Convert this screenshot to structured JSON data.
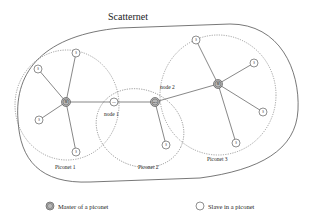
{
  "title": "Scatternet",
  "piconets": [
    {
      "id": "p1",
      "label": "Piconet 1"
    },
    {
      "id": "p2",
      "label": "Piconet 2"
    },
    {
      "id": "p3",
      "label": "Piconet 3"
    }
  ],
  "nodes": [
    {
      "id": "m1",
      "label": "M",
      "type": "master"
    },
    {
      "id": "m3",
      "label": "M",
      "type": "master"
    },
    {
      "id": "n1",
      "label": "S/S",
      "type": "bridge",
      "caption": "node 1"
    },
    {
      "id": "n2",
      "label": "M/S",
      "type": "bridge-master",
      "caption": "node 2"
    },
    {
      "id": "s1a",
      "label": "S",
      "type": "slave"
    },
    {
      "id": "s1b",
      "label": "S",
      "type": "slave"
    },
    {
      "id": "s1c",
      "label": "S",
      "type": "slave"
    },
    {
      "id": "s1d",
      "label": "S",
      "type": "slave"
    },
    {
      "id": "s2a",
      "label": "S",
      "type": "slave"
    },
    {
      "id": "s3a",
      "label": "S",
      "type": "slave"
    },
    {
      "id": "s3b",
      "label": "S",
      "type": "slave"
    },
    {
      "id": "s3c",
      "label": "S",
      "type": "slave"
    },
    {
      "id": "s3d",
      "label": "S",
      "type": "slave"
    }
  ],
  "links": [
    [
      "m1",
      "s1a"
    ],
    [
      "m1",
      "s1b"
    ],
    [
      "m1",
      "s1c"
    ],
    [
      "m1",
      "s1d"
    ],
    [
      "m1",
      "n1"
    ],
    [
      "n1",
      "n2"
    ],
    [
      "n2",
      "s2a"
    ],
    [
      "n2",
      "m3"
    ],
    [
      "m3",
      "s3a"
    ],
    [
      "m3",
      "s3b"
    ],
    [
      "m3",
      "s3c"
    ],
    [
      "m3",
      "s3d"
    ]
  ],
  "legend": {
    "master": {
      "symbol": "M",
      "label": "Master of a piconet"
    },
    "slave": {
      "symbol": "S",
      "label": "Slave in a piconet"
    }
  },
  "colors": {
    "line": "#555555",
    "master_fill": "#b8b8b8",
    "slave_fill": "#ffffff"
  }
}
